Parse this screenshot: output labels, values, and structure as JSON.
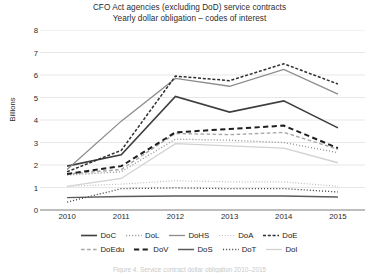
{
  "chart_data": {
    "type": "line",
    "title": "CFO Act agencies (excluding DoD) service contracts",
    "subtitle": "Yearly dollar obligation – codes of interest",
    "xlabel": "",
    "ylabel": "Billions",
    "categories": [
      "2010",
      "2011",
      "2012",
      "2013",
      "2014",
      "2015"
    ],
    "x": [
      2010,
      2011,
      2012,
      2013,
      2014,
      2015
    ],
    "ylim": [
      0,
      8
    ],
    "yticks": [
      0,
      1,
      2,
      3,
      4,
      5,
      6,
      7,
      8
    ],
    "grid": true,
    "legend_position": "bottom",
    "series": [
      {
        "name": "DoC",
        "values": [
          1.95,
          2.45,
          5.05,
          4.35,
          4.85,
          3.65
        ],
        "style": "solid",
        "color": "#3f3f3f",
        "width": 1.6
      },
      {
        "name": "DoL",
        "values": [
          1.55,
          1.7,
          3.15,
          3.1,
          3.0,
          2.55
        ],
        "style": "dotted",
        "color": "#9a9a9a",
        "width": 1.3
      },
      {
        "name": "DoHS",
        "values": [
          1.8,
          3.95,
          5.85,
          5.5,
          6.25,
          5.15
        ],
        "style": "solid",
        "color": "#8c8c8c",
        "width": 1.3
      },
      {
        "name": "DoA",
        "values": [
          1.05,
          1.15,
          1.3,
          1.25,
          1.25,
          1.05
        ],
        "style": "dotted",
        "color": "#bdbdbd",
        "width": 1.2
      },
      {
        "name": "DoE",
        "values": [
          1.7,
          2.65,
          5.95,
          5.75,
          6.5,
          5.6
        ],
        "style": "dashdot",
        "color": "#2e2e2e",
        "width": 1.5
      },
      {
        "name": "DoEdu",
        "values": [
          1.6,
          1.8,
          3.4,
          3.35,
          3.45,
          2.7
        ],
        "style": "dashed",
        "color": "#a8a8a8",
        "width": 1.4
      },
      {
        "name": "DoV",
        "values": [
          1.6,
          1.95,
          3.45,
          3.6,
          3.75,
          2.75
        ],
        "style": "dashed",
        "color": "#1f1f1f",
        "width": 2.0
      },
      {
        "name": "DoS",
        "values": [
          0.55,
          0.6,
          0.62,
          0.62,
          0.62,
          0.58
        ],
        "style": "solid",
        "color": "#5a5a5a",
        "width": 1.5
      },
      {
        "name": "DoT",
        "values": [
          0.35,
          0.95,
          0.98,
          0.95,
          0.95,
          0.8
        ],
        "style": "dotted",
        "color": "#4a4a4a",
        "width": 1.3
      },
      {
        "name": "DoI",
        "values": [
          1.05,
          1.4,
          2.95,
          2.85,
          2.75,
          2.1
        ],
        "style": "solid",
        "color": "#d2d2d2",
        "width": 1.3
      }
    ]
  },
  "caption": "Figure 4. Service contract dollar obligation 2010–2015"
}
